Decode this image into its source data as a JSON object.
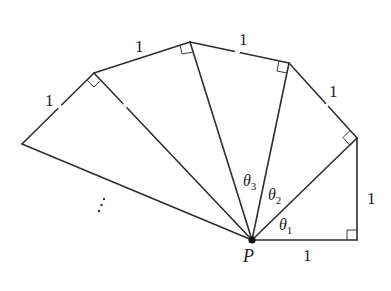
{
  "diagram": {
    "point_label": "P",
    "side_labels": [
      "1",
      "1",
      "1",
      "1",
      "1",
      "1"
    ],
    "angle_labels": [
      {
        "symbol": "θ",
        "sub": "1"
      },
      {
        "symbol": "θ",
        "sub": "2"
      },
      {
        "symbol": "θ",
        "sub": "3"
      }
    ],
    "continuation": "⋮",
    "points": {
      "P": [
        252,
        240
      ],
      "A1": [
        357,
        240
      ],
      "A2": [
        357,
        138
      ],
      "A3": [
        289,
        63
      ],
      "A4": [
        190,
        42
      ],
      "A5": [
        94,
        73
      ],
      "A6": [
        22,
        144
      ]
    }
  }
}
